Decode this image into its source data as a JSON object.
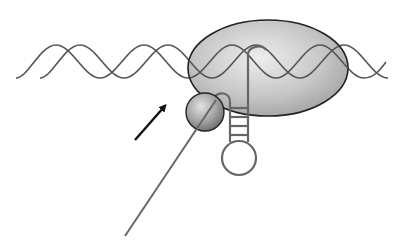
{
  "diagram": {
    "elements": {
      "dna_helix": {
        "label": "",
        "stroke": "#555555"
      },
      "rna_polymerase": {
        "label": "",
        "fill_light": "#e6e6e6",
        "fill_dark": "#9a9a9a",
        "stroke": "#222222"
      },
      "rho_factor": {
        "label": "",
        "fill_light": "#d8d8d8",
        "fill_dark": "#6e6e6e",
        "stroke": "#222222"
      },
      "rna_hairpin": {
        "label": "",
        "stroke": "#666666"
      },
      "rna_strand": {
        "label": "",
        "stroke": "#666666"
      },
      "direction_arrow": {
        "label": "",
        "color": "#111111"
      }
    }
  }
}
